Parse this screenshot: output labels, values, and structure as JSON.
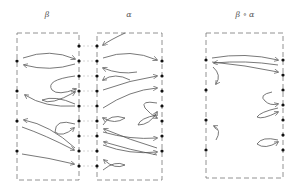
{
  "panels": [
    {
      "id": "beta",
      "title": "β",
      "title_x": 47
    },
    {
      "id": "alpha",
      "title": "α",
      "title_x": 129
    },
    {
      "id": "composite",
      "title": "β ∘ α",
      "title_x": 245
    }
  ],
  "colors": {
    "stroke": "#555555",
    "dot": "#111111",
    "dash": "#777777"
  }
}
